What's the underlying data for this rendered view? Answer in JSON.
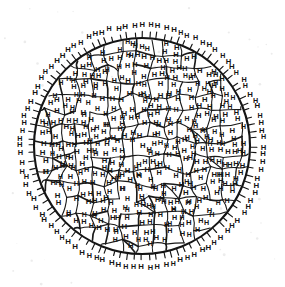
{
  "figure": {
    "kind": "scanned-line-drawing",
    "background_color": "#ffffff",
    "ink_color": "#141414",
    "symbol": "H",
    "symbol_meaning": "hydrogen-atom-label",
    "boundary": {
      "shape": "circle",
      "center_x": 142,
      "center_y": 146,
      "radius": 108,
      "stroke_width": 2.1,
      "stroke_color": "#141414"
    },
    "interior_network": {
      "description": "irregular wavy polygonal cell network (grain boundaries)",
      "stroke_width": 1.1,
      "stroke_color": "#1a1a1a",
      "approx_cell_count": 150
    },
    "exterior_symbols": {
      "description": "H symbols outside circle joined by short radial stems",
      "count": 96,
      "stem_length": 6,
      "ring_offset": 13
    },
    "interior_symbols": {
      "count": 430,
      "font_size_px": 7.2,
      "weight": "bold"
    },
    "scan_artifacts": {
      "specks_visible": true,
      "speck_color": "#ececec"
    }
  },
  "chart_data": {
    "type": "scatter",
    "xlabel": "",
    "ylabel": "",
    "grid": false,
    "legend": null,
    "series": [
      {
        "name": "interior-H-labels",
        "marker": "H",
        "count": 430
      },
      {
        "name": "exterior-H-labels",
        "marker": "H",
        "count": 96
      }
    ],
    "annotations": [
      "H"
    ]
  }
}
